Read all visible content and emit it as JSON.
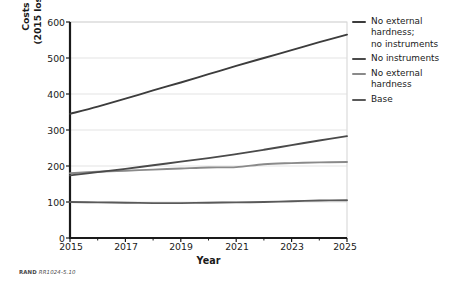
{
  "chart_data": {
    "type": "line",
    "title": "",
    "xlabel": "Year",
    "ylabel_line1": "Costs over time, by percentage",
    "ylabel_line2": "(2015 losses to cyberattack = 100%)",
    "xlim": [
      2015,
      2025
    ],
    "ylim": [
      0,
      600
    ],
    "x_tick_labels": [
      "2015",
      "2017",
      "2019",
      "2021",
      "2023",
      "2025"
    ],
    "x_tick_values": [
      2015,
      2017,
      2019,
      2021,
      2023,
      2025
    ],
    "x_minor_ticks": [
      2016,
      2018,
      2020,
      2022,
      2024
    ],
    "y_tick_labels": [
      "0",
      "100",
      "200",
      "300",
      "400",
      "500",
      "600"
    ],
    "y_tick_values": [
      0,
      100,
      200,
      300,
      400,
      500,
      600
    ],
    "grid": "horizontal",
    "legend_position": "right",
    "x": [
      2015,
      2016,
      2017,
      2018,
      2019,
      2020,
      2021,
      2022,
      2023,
      2024,
      2025
    ],
    "series": [
      {
        "name": "No external hardness; no instruments",
        "color": "#3c3c3c",
        "values": [
          345,
          365,
          387,
          410,
          432,
          455,
          478,
          500,
          522,
          544,
          565
        ]
      },
      {
        "name": "No instruments",
        "color": "#4a4a4a",
        "values": [
          174,
          183,
          192,
          202,
          212,
          222,
          233,
          245,
          258,
          271,
          283
        ]
      },
      {
        "name": "No external hardness",
        "color": "#8a8a8a",
        "values": [
          180,
          184,
          187,
          190,
          193,
          196,
          197,
          205,
          208,
          210,
          211
        ]
      },
      {
        "name": "Base",
        "color": "#5a5a5a",
        "values": [
          100,
          99,
          98,
          97,
          97,
          98,
          99,
          100,
          102,
          104,
          105
        ]
      }
    ]
  },
  "legend": {
    "items": [
      {
        "label": "No external\nhardness;\nno instruments",
        "color": "#3c3c3c"
      },
      {
        "label": "No instruments",
        "color": "#4a4a4a"
      },
      {
        "label": "No external\nhardness",
        "color": "#8a8a8a"
      },
      {
        "label": "Base",
        "color": "#5a5a5a"
      }
    ]
  },
  "source_note": {
    "prefix": "RAND",
    "id": "RR1024-5.10"
  },
  "style": {
    "axis_color": "#1a1a1a",
    "grid_color": "#dcdcdc",
    "plot_border_color": "#c8c8c8",
    "text_color": "#1a1a1a"
  }
}
